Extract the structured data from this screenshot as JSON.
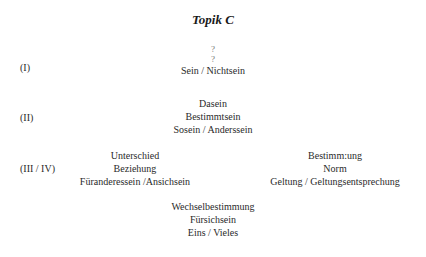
{
  "title": "Topik C",
  "levels": [
    {
      "label": "(I)",
      "lines": [
        "?",
        "?",
        "Sein / Nichtsein"
      ]
    },
    {
      "label": "(II)",
      "lines": [
        "Dasein",
        "Bestimmtsein",
        "Sosein / Anderssein"
      ]
    },
    {
      "label": "(III / IV)",
      "left_lines": [
        "Unterschied",
        "Beziehung",
        "Füranderessein /Ansichsein"
      ],
      "right_lines": [
        "Bestimm:ung",
        "Norm",
        "Geltung / Geltungsentsprechung"
      ]
    },
    {
      "label": "",
      "lines": [
        "Wechselbestimmung",
        "Fürsichsein",
        "Eins / Vieles"
      ]
    }
  ]
}
